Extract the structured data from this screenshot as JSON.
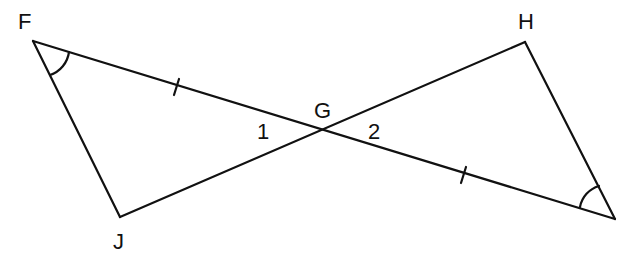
{
  "diagram": {
    "type": "geometry",
    "points": {
      "F": {
        "label": "F",
        "x": 33,
        "y": 41
      },
      "J": {
        "label": "J",
        "x": 120,
        "y": 217
      },
      "G": {
        "label": "G",
        "x": 323,
        "y": 130
      },
      "H": {
        "label": "H",
        "x": 525,
        "y": 42
      },
      "K": {
        "label": "",
        "x": 615,
        "y": 219
      }
    },
    "angle_labels": {
      "one": "1",
      "two": "2"
    },
    "segments": [
      "FG",
      "GK",
      "JG",
      "GH",
      "FJ",
      "HK"
    ],
    "congruent_segments": [
      "FG",
      "GK"
    ],
    "congruent_angles": [
      "F",
      "K"
    ],
    "stroke_color": "#111111",
    "background": "#ffffff"
  }
}
